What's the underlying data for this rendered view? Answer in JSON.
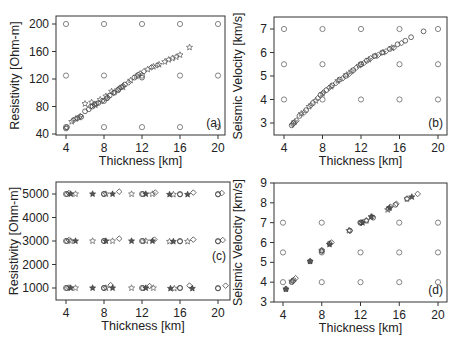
{
  "chart_data": [
    {
      "panel": "a",
      "type": "scatter",
      "title": "",
      "panel_label": "(a)",
      "xlabel": "Thickness [km]",
      "ylabel": "Resistivity [Ohm-m]",
      "xlim": [
        3,
        21
      ],
      "ylim": [
        40,
        210
      ],
      "xticks": [
        4,
        8,
        12,
        16,
        20
      ],
      "yticks": [
        40,
        80,
        120,
        160,
        200
      ],
      "grid": false,
      "reference_points": {
        "x": [
          4,
          8,
          12,
          16,
          20,
          4,
          8,
          12,
          16,
          20,
          4,
          8,
          12,
          16,
          20
        ],
        "y": [
          50,
          50,
          50,
          50,
          50,
          125,
          125,
          125,
          125,
          125,
          200,
          200,
          200,
          200,
          200
        ]
      },
      "series": [
        {
          "name": "inverted (circles)",
          "marker": "circle",
          "x": [
            4.0,
            4.1,
            5.2,
            5.6,
            6.0,
            6.4,
            6.8,
            7.0,
            7.4,
            8.0,
            8.3,
            8.6,
            9.1,
            9.5,
            9.8,
            10.2,
            11.2,
            11.6,
            12.0
          ],
          "y": [
            48,
            50,
            63,
            65,
            73,
            76,
            80,
            83,
            85,
            88,
            92,
            96,
            100,
            104,
            108,
            112,
            122,
            126,
            122
          ]
        },
        {
          "name": "inverted (diamonds)",
          "marker": "diamond",
          "x": [
            4.8,
            5.5,
            6.6,
            7.2,
            7.8,
            8.4,
            9.0,
            9.6,
            10.0,
            10.6,
            11.8,
            12.2,
            13.0,
            13.6
          ],
          "y": [
            60,
            66,
            80,
            84,
            88,
            93,
            100,
            106,
            110,
            115,
            128,
            131,
            137,
            140
          ]
        },
        {
          "name": "inverted (stars)",
          "marker": "star",
          "x": [
            4.6,
            5.0,
            5.4,
            6.0,
            6.7,
            7.1,
            7.6,
            8.2,
            8.8,
            9.4,
            10.0,
            10.8,
            11.4,
            12.6,
            13.2,
            13.8,
            14.4,
            14.8,
            15.2,
            15.6,
            16.0,
            17.0
          ],
          "y": [
            58,
            62,
            64,
            84,
            86,
            82,
            90,
            95,
            102,
            104,
            108,
            118,
            124,
            134,
            138,
            141,
            145,
            148,
            150,
            152,
            155,
            166
          ]
        }
      ]
    },
    {
      "panel": "b",
      "type": "scatter",
      "title": "",
      "panel_label": "(b)",
      "xlabel": "Thickness [km]",
      "ylabel": "Seismic Velocity [km/s]",
      "xlim": [
        3,
        21
      ],
      "ylim": [
        2.5,
        7.5
      ],
      "xticks": [
        4,
        8,
        12,
        16,
        20
      ],
      "yticks": [
        3,
        4,
        5,
        6,
        7
      ],
      "grid": false,
      "reference_points": {
        "x": [
          4,
          8,
          12,
          16,
          20,
          4,
          8,
          12,
          16,
          20,
          4,
          8,
          12,
          16,
          20
        ],
        "y": [
          4,
          4,
          4,
          4,
          4,
          5.5,
          5.5,
          5.5,
          5.5,
          5.5,
          7,
          7,
          7,
          7,
          7
        ]
      },
      "series": [
        {
          "name": "inverted (circles)",
          "marker": "circle",
          "x": [
            4.8,
            5.0,
            5.6,
            6.3,
            7.0,
            7.8,
            8.4,
            9.0,
            9.8,
            10.4,
            11.2,
            12.0,
            12.6,
            13.4,
            14.2,
            15.0,
            15.8,
            16.6,
            17.2,
            18.5
          ],
          "y": [
            2.9,
            3.0,
            3.3,
            3.55,
            3.85,
            4.2,
            4.4,
            4.6,
            4.85,
            5.0,
            5.25,
            5.5,
            5.65,
            5.85,
            6.0,
            6.15,
            6.35,
            6.5,
            6.65,
            6.9
          ]
        },
        {
          "name": "inverted (diamonds)",
          "marker": "diamond",
          "x": [
            4.9,
            5.3,
            6.1,
            6.8,
            7.5,
            8.1,
            8.7,
            9.4,
            10.1,
            10.8,
            11.5,
            12.3,
            13.0,
            13.8,
            14.6,
            15.4,
            16.2
          ],
          "y": [
            2.95,
            3.1,
            3.45,
            3.75,
            4.05,
            4.3,
            4.5,
            4.7,
            4.9,
            5.1,
            5.35,
            5.55,
            5.75,
            5.9,
            6.05,
            6.2,
            6.4
          ]
        },
        {
          "name": "inverted (stars)",
          "marker": "star",
          "x": [
            5.1,
            5.8,
            6.6,
            7.3,
            8.0,
            8.9,
            9.6,
            10.5,
            11.0,
            11.8,
            12.8,
            13.5,
            14.3,
            15.2
          ],
          "y": [
            3.05,
            3.4,
            3.7,
            3.95,
            4.25,
            4.55,
            4.8,
            5.05,
            5.2,
            5.45,
            5.7,
            5.85,
            6.0,
            6.2
          ]
        }
      ]
    },
    {
      "panel": "c",
      "type": "scatter",
      "title": "",
      "panel_label": "(c)",
      "xlabel": "Thickness [km]",
      "ylabel": "Resistivity [Ohm-m]",
      "xlim": [
        3,
        21
      ],
      "ylim": [
        500,
        5500
      ],
      "xticks": [
        4,
        8,
        12,
        16,
        20
      ],
      "yticks": [
        1000,
        2000,
        3000,
        4000,
        5000
      ],
      "grid": false,
      "reference_points": {
        "x": [
          4,
          8,
          12,
          16,
          20,
          4,
          8,
          12,
          16,
          20,
          4,
          8,
          12,
          16,
          20
        ],
        "y": [
          1000,
          1000,
          1000,
          1000,
          1000,
          3000,
          3000,
          3000,
          3000,
          3000,
          5000,
          5000,
          5000,
          5000,
          5000
        ]
      },
      "series": [
        {
          "name": "inverted (circles)",
          "marker": "circle",
          "x": [
            4.1,
            8.0,
            12.1,
            16.0,
            20.0,
            4.1,
            8.0,
            12.1,
            16.0,
            20.0,
            4.1,
            8.0,
            12.1,
            16.0,
            20.0
          ],
          "y": [
            1000,
            1000,
            1000,
            1000,
            980,
            3000,
            3000,
            3000,
            2980,
            2980,
            5000,
            5000,
            5000,
            4980,
            4980
          ]
        },
        {
          "name": "inverted (diamonds)",
          "marker": "diamond",
          "x": [
            4.3,
            8.7,
            12.8,
            17.0,
            20.8,
            4.3,
            9.6,
            13.3,
            17.4,
            20.5,
            4.3,
            9.6,
            13.4,
            17.4,
            20.4
          ],
          "y": [
            1020,
            1120,
            1080,
            1100,
            1100,
            3040,
            3100,
            3060,
            3060,
            3040,
            5040,
            5100,
            5060,
            5060,
            5040
          ]
        },
        {
          "name": "inverted (stars)",
          "marker": "star",
          "x": [
            4.5,
            5.0,
            6.8,
            8.2,
            8.9,
            10.9,
            12.4,
            13.2,
            15.0,
            15.4,
            17.3,
            4.5,
            5.0,
            6.8,
            8.2,
            8.9,
            10.9,
            12.4,
            13.1,
            14.9,
            15.3,
            16.8,
            4.5,
            5.0,
            6.8,
            8.2,
            8.9,
            10.9,
            12.4,
            13.1,
            14.9,
            15.3,
            16.8
          ],
          "y": [
            1000,
            1000,
            1000,
            1000,
            1000,
            1000,
            1000,
            1000,
            980,
            980,
            980,
            3000,
            3000,
            3000,
            3000,
            3000,
            3000,
            3000,
            3000,
            2980,
            2980,
            2980,
            5000,
            5000,
            5000,
            5000,
            5000,
            5000,
            5000,
            5000,
            4980,
            4980,
            4980
          ]
        }
      ]
    },
    {
      "panel": "d",
      "type": "scatter",
      "title": "",
      "panel_label": "(d)",
      "xlabel": "Thickness [km]",
      "ylabel": "Seismic Velocity [km/s]",
      "xlim": [
        3,
        21
      ],
      "ylim": [
        3,
        9
      ],
      "xticks": [
        4,
        8,
        12,
        16,
        20
      ],
      "yticks": [
        3,
        4,
        5,
        6,
        7,
        8,
        9
      ],
      "grid": false,
      "reference_points": {
        "x": [
          4,
          8,
          12,
          16,
          20,
          4,
          8,
          12,
          16,
          20,
          4,
          8,
          12,
          16,
          20
        ],
        "y": [
          4,
          4,
          4,
          4,
          4,
          5.5,
          5.5,
          5.5,
          5.5,
          5.5,
          7,
          7,
          7,
          7,
          7
        ]
      },
      "series": [
        {
          "name": "inverted (circles)",
          "marker": "circle",
          "x": [
            4.3,
            4.9,
            5.1,
            6.8,
            8.0,
            8.8,
            10.9,
            12.0,
            12.6,
            13.3,
            14.9,
            15.6,
            16.8
          ],
          "y": [
            3.65,
            4.0,
            4.1,
            5.05,
            5.6,
            5.95,
            6.6,
            7.0,
            7.1,
            7.25,
            7.7,
            7.9,
            8.2
          ]
        },
        {
          "name": "inverted (diamonds)",
          "marker": "diamond",
          "x": [
            5.0,
            5.3,
            8.0,
            9.0,
            10.9,
            12.1,
            13.2,
            15.1,
            15.7,
            17.9
          ],
          "y": [
            4.05,
            4.2,
            5.55,
            6.0,
            6.6,
            7.0,
            7.3,
            7.8,
            7.95,
            8.45
          ]
        },
        {
          "name": "inverted (stars)",
          "marker": "star",
          "x": [
            4.3,
            4.9,
            6.8,
            8.0,
            8.8,
            10.8,
            12.2,
            12.6,
            13.1,
            14.8,
            15.0,
            16.8,
            17.3
          ],
          "y": [
            3.65,
            4.05,
            5.05,
            5.6,
            5.9,
            6.6,
            7.0,
            7.1,
            7.3,
            7.65,
            7.75,
            8.2,
            8.3
          ]
        }
      ]
    }
  ],
  "layout": {
    "panels": [
      {
        "id": "a",
        "box": [
          56,
          16,
          225,
          135
        ],
        "xpix": [
          66,
          218
        ],
        "ypix": [
          134,
          24
        ],
        "yvals": [
          40,
          200
        ]
      },
      {
        "id": "b",
        "box": [
          274,
          17,
          447,
          135
        ],
        "xpix": [
          284,
          438
        ],
        "ypix": [
          123,
          29
        ],
        "yvals": [
          3,
          7
        ]
      },
      {
        "id": "c",
        "box": [
          56,
          182,
          230,
          300
        ],
        "xpix": [
          66,
          218
        ],
        "ypix": [
          288,
          194
        ],
        "yvals": [
          1000,
          5000
        ]
      },
      {
        "id": "d",
        "box": [
          274,
          183,
          447,
          302
        ],
        "xpix": [
          283,
          438
        ],
        "ypix": [
          302,
          183
        ],
        "yvals": [
          3,
          9
        ]
      }
    ]
  },
  "labels": {
    "a": {
      "xlabel": "Thickness [km]",
      "ylabel": "Resistivity [Ohm-m]",
      "panel": "(a)"
    },
    "b": {
      "xlabel": "Thickness [km]",
      "ylabel": "Seismic Velocity [km/s]",
      "panel": "(b)"
    },
    "c": {
      "xlabel": "Thickness [km]",
      "ylabel": "Resistivity [Ohm-m]",
      "panel": "(c)"
    },
    "d": {
      "xlabel": "Thickness [km]",
      "ylabel": "Seismic Velocity [km/s]",
      "panel": "(d)"
    }
  }
}
